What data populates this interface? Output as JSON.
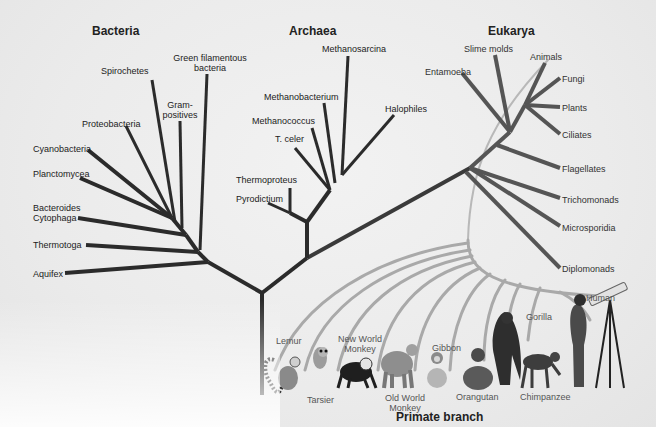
{
  "domains": {
    "bacteria": {
      "title": "Bacteria",
      "taxa": [
        "Spirochetes",
        "Green filamentous bacteria",
        "Gram-positives",
        "Proteobacteria",
        "Cyanobacteria",
        "Planctomycea",
        "Bacteroides Cytophaga",
        "Thermotoga",
        "Aquifex"
      ]
    },
    "archaea": {
      "title": "Archaea",
      "taxa": [
        "Methanosarcina",
        "Methanobacterium",
        "Methanococcus",
        "T. celer",
        "Halophiles",
        "Thermoproteus",
        "Pyrodictium"
      ]
    },
    "eukarya": {
      "title": "Eukarya",
      "taxa": [
        "Slime molds",
        "Entamoeba",
        "Animals",
        "Fungi",
        "Plants",
        "Ciliates",
        "Flagellates",
        "Trichomonads",
        "Microsporidia",
        "Diplomonads"
      ]
    }
  },
  "labels": {
    "spirochetes": "Spirochetes",
    "green_fil_1": "Green filamentous",
    "green_fil_2": "bacteria",
    "gram_1": "Gram-",
    "gram_2": "positives",
    "proteobacteria": "Proteobacteria",
    "cyanobacteria": "Cyanobacteria",
    "planctomycea": "Planctomycea",
    "bacteroides": "Bacteroides",
    "cytophaga": "Cytophaga",
    "thermotoga": "Thermotoga",
    "aquifex": "Aquifex",
    "methanosarcina": "Methanosarcina",
    "methanobacterium": "Methanobacterium",
    "methanococcus": "Methanococcus",
    "tceler": "T. celer",
    "halophiles": "Halophiles",
    "thermoproteus": "Thermoproteus",
    "pyrodictium": "Pyrodictium",
    "slime_molds": "Slime molds",
    "entamoeba": "Entamoeba",
    "animals": "Animals",
    "fungi": "Fungi",
    "plants": "Plants",
    "ciliates": "Ciliates",
    "flagellates": "Flagellates",
    "trichomonads": "Trichomonads",
    "microsporidia": "Microsporidia",
    "diplomonads": "Diplomonads"
  },
  "primates": {
    "title": "Primate branch",
    "lemur": "Lemur",
    "tarsier": "Tarsier",
    "nwm_1": "New World",
    "nwm_2": "Monkey",
    "owm_1": "Old World",
    "owm_2": "Monkey",
    "gibbon": "Gibbon",
    "orangutan": "Orangutan",
    "gorilla": "Gorilla",
    "chimpanzee": "Chimpanzee",
    "human": "Human"
  },
  "colors": {
    "branch_dark": "#2b2b2b",
    "branch_euk": "#555555",
    "branch_primate": "#a8a8a8"
  }
}
